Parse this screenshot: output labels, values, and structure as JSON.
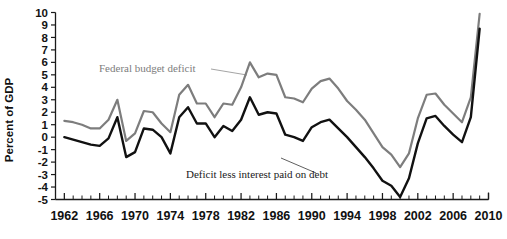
{
  "chart_data": {
    "type": "line",
    "title": "",
    "xlabel": "",
    "ylabel": "Percent of GDP",
    "xlim": [
      1961,
      2010
    ],
    "ylim": [
      -5,
      10
    ],
    "ytick_step": 1,
    "xtick_step": 1,
    "xtick_label_step": 4,
    "grid": false,
    "legend_position": "inline-annotations",
    "ytick_labels": [
      "10",
      "9",
      "8",
      "7",
      "6",
      "5",
      "4",
      "3",
      "2",
      "1",
      "0",
      "-1",
      "-2",
      "-3",
      "-4",
      "-5"
    ],
    "ytick_values": [
      10,
      9,
      8,
      7,
      6,
      5,
      4,
      3,
      2,
      1,
      0,
      -1,
      -2,
      -3,
      -4,
      -5
    ],
    "xtick_labels": [
      "1962",
      "1966",
      "1970",
      "1974",
      "1978",
      "1982",
      "1986",
      "1990",
      "1994",
      "1998",
      "2002",
      "2006",
      "2010"
    ],
    "xtick_values": [
      1962,
      1966,
      1970,
      1974,
      1978,
      1982,
      1986,
      1990,
      1994,
      1998,
      2002,
      2006,
      2010
    ],
    "x": [
      1962,
      1963,
      1964,
      1965,
      1966,
      1967,
      1968,
      1969,
      1970,
      1971,
      1972,
      1973,
      1974,
      1975,
      1976,
      1977,
      1978,
      1979,
      1980,
      1981,
      1982,
      1983,
      1984,
      1985,
      1986,
      1987,
      1988,
      1989,
      1990,
      1991,
      1992,
      1993,
      1994,
      1995,
      1996,
      1997,
      1998,
      1999,
      2000,
      2001,
      2002,
      2003,
      2004,
      2005,
      2006,
      2007,
      2008,
      2009
    ],
    "series": [
      {
        "name": "Federal budget deficit",
        "color": "#7d7d7d",
        "values": [
          1.3,
          1.2,
          1.0,
          0.7,
          0.7,
          1.4,
          3.0,
          -0.3,
          0.3,
          2.1,
          2.0,
          1.1,
          0.4,
          3.4,
          4.2,
          2.7,
          2.7,
          1.6,
          2.7,
          2.6,
          4.0,
          6.0,
          4.8,
          5.1,
          5.0,
          3.2,
          3.1,
          2.8,
          3.9,
          4.5,
          4.7,
          3.9,
          2.9,
          2.2,
          1.4,
          0.3,
          -0.8,
          -1.4,
          -2.4,
          -1.3,
          1.5,
          3.4,
          3.5,
          2.6,
          1.9,
          1.2,
          3.2,
          9.9
        ]
      },
      {
        "name": "Deficit less interest paid on debt",
        "color": "#111111",
        "values": [
          0.0,
          -0.2,
          -0.4,
          -0.6,
          -0.7,
          -0.1,
          1.6,
          -1.6,
          -1.2,
          0.7,
          0.6,
          0.0,
          -1.3,
          1.6,
          2.4,
          1.1,
          1.1,
          0.0,
          0.9,
          0.5,
          1.4,
          3.2,
          1.8,
          2.0,
          1.9,
          0.2,
          0.0,
          -0.3,
          0.8,
          1.2,
          1.4,
          0.7,
          0.0,
          -0.8,
          -1.6,
          -2.5,
          -3.5,
          -3.9,
          -4.8,
          -3.3,
          -0.5,
          1.5,
          1.7,
          0.9,
          0.2,
          -0.4,
          1.6,
          8.7
        ]
      }
    ],
    "annotations": [
      {
        "text": "Federal budget deficit",
        "color": "#7d7d7d",
        "x": 99,
        "y": 72,
        "leader": "M 211 69 L 247 75"
      },
      {
        "text": "Deficit less interest paid on debt",
        "color": "#1a1a1a",
        "x": 186,
        "y": 178,
        "leader": "M 316 173 L 281 158"
      }
    ]
  },
  "axes": {
    "y_axis_title": "Percent of GDP"
  }
}
